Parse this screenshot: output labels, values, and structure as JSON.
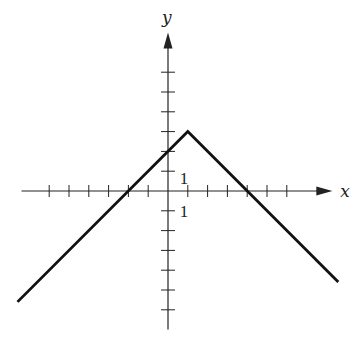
{
  "chart_data": {
    "type": "line",
    "title": "",
    "xlabel": "x",
    "ylabel": "y",
    "function": "y = -|x - 1| + 3",
    "series": [
      {
        "name": "piecewise-linear",
        "points": [
          [
            -7.6,
            -5.6
          ],
          [
            1,
            3
          ],
          [
            8.6,
            -4.6
          ]
        ],
        "color": "#111111"
      }
    ],
    "key_points": {
      "vertex": [
        1,
        3
      ],
      "y_intercept": [
        0,
        2
      ],
      "x_intercepts": [
        [
          -2,
          0
        ],
        [
          4,
          0
        ]
      ]
    },
    "xlim": [
      -7.4,
      8.3
    ],
    "ylim": [
      -7,
      8
    ],
    "x_ticks": [
      -6,
      -5,
      -4,
      -3,
      -2,
      -1,
      1,
      2,
      3,
      4,
      5,
      6
    ],
    "y_ticks": [
      -6,
      -5,
      -4,
      -3,
      -2,
      -1,
      1,
      2,
      3,
      4,
      5,
      6
    ],
    "tick_labels": [
      {
        "axis": "y",
        "value": 1,
        "text": "1"
      },
      {
        "axis": "x",
        "value": 1,
        "text": "1"
      }
    ],
    "grid": false,
    "legend": null,
    "colors": {
      "axis": "#222222",
      "line": "#111111",
      "background": "#ffffff"
    }
  },
  "labels": {
    "x_axis": "x",
    "y_axis": "y",
    "unit_y": "1",
    "unit_x": "1"
  },
  "layout": {
    "origin_px": [
      168,
      191
    ],
    "unit_px": 19.8
  }
}
